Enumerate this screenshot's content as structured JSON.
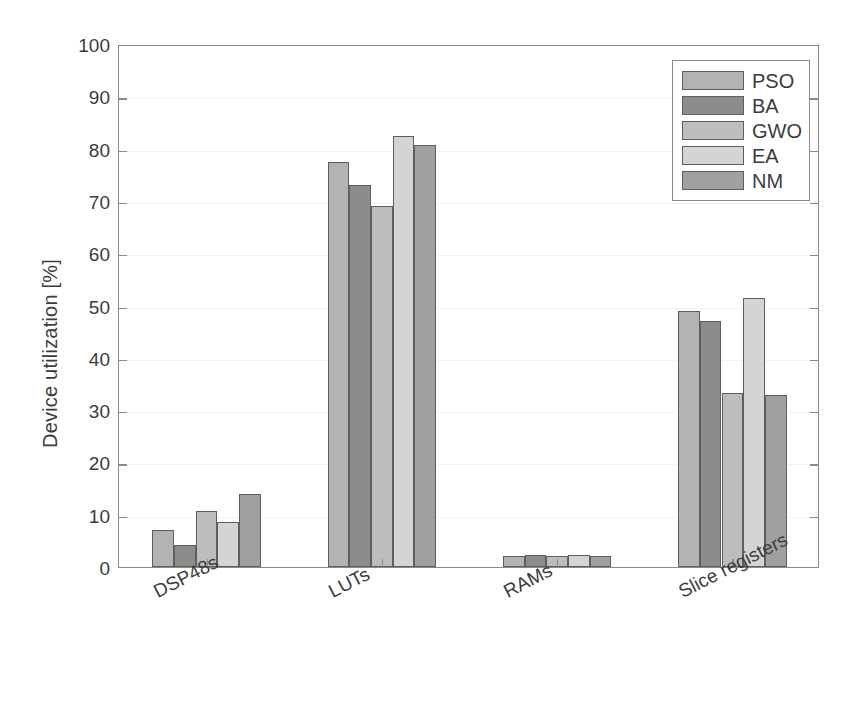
{
  "chart_data": {
    "type": "bar",
    "title": "",
    "xlabel": "",
    "ylabel": "Device utilization [%]",
    "categories": [
      "DSP48s",
      "LUTs",
      "RAMs",
      "Slice registers"
    ],
    "series": [
      {
        "name": "PSO",
        "color": "#b3b3b3",
        "values": [
          7.0,
          77.5,
          2.2,
          49.0
        ]
      },
      {
        "name": "BA",
        "color": "#8c8c8c",
        "values": [
          4.2,
          73.0,
          2.3,
          47.1
        ]
      },
      {
        "name": "GWO",
        "color": "#bdbdbd",
        "values": [
          10.8,
          69.0,
          2.2,
          33.2
        ]
      },
      {
        "name": "EA",
        "color": "#d4d4d4",
        "values": [
          8.7,
          82.5,
          2.3,
          51.4
        ]
      },
      {
        "name": "NM",
        "color": "#a0a0a0",
        "values": [
          14.0,
          80.7,
          2.1,
          32.8
        ]
      }
    ],
    "ylim": [
      0,
      100
    ],
    "yticks": [
      0,
      10,
      20,
      30,
      40,
      50,
      60,
      70,
      80,
      90,
      100
    ],
    "ytick_labels": [
      "0",
      "10",
      "20",
      "30",
      "40",
      "50",
      "60",
      "70",
      "80",
      "90",
      "100"
    ],
    "grid": true,
    "legend_position": "upper right"
  }
}
